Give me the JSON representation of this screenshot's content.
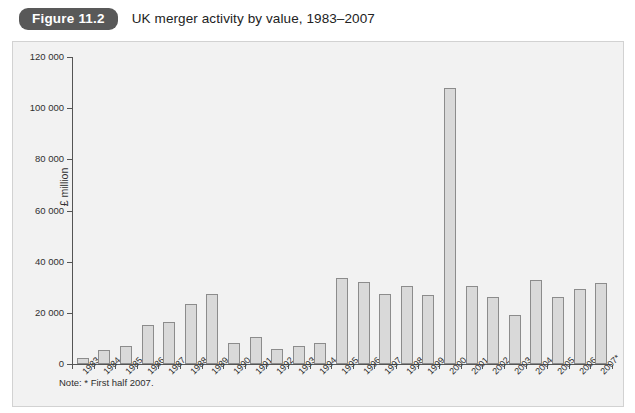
{
  "header": {
    "badge_label": "Figure 11.2",
    "title": "UK merger activity by value, 1983–2007"
  },
  "note": "Note: * First half 2007.",
  "colors": {
    "badge_bg": "#595959",
    "panel_bg": "#f2f2f2",
    "bar_fill": "#d9d9d9",
    "bar_stroke": "#8c8c8c",
    "axis": "#555555"
  },
  "chart_data": {
    "type": "bar",
    "title": "UK merger activity by value, 1983–2007",
    "xlabel": "",
    "ylabel": "£ million",
    "ylim": [
      0,
      120000
    ],
    "yticks": [
      0,
      20000,
      40000,
      60000,
      80000,
      100000,
      120000
    ],
    "ytick_labels": [
      "0",
      "20 000",
      "40 000",
      "60 000",
      "80 000",
      "100 000",
      "120 000"
    ],
    "grid": false,
    "legend": null,
    "annotations": [
      "Note: * First half 2007."
    ],
    "categories": [
      "1983",
      "1984",
      "1985",
      "1986",
      "1987",
      "1988",
      "1989",
      "1990",
      "1991",
      "1992",
      "1993",
      "1994",
      "1995",
      "1996",
      "1997",
      "1998",
      "1999",
      "2000",
      "2001",
      "2002",
      "2003",
      "2004",
      "2005",
      "2006",
      "2007*"
    ],
    "values": [
      2300,
      5500,
      7100,
      15400,
      16500,
      23500,
      27500,
      8300,
      10600,
      6000,
      7100,
      8300,
      33500,
      32000,
      27500,
      30500,
      27000,
      108000,
      30500,
      26000,
      19000,
      32700,
      26000,
      29500,
      31700
    ],
    "series": [
      {
        "name": "UK merger activity by value (£ million)",
        "values": [
          2300,
          5500,
          7100,
          15400,
          16500,
          23500,
          27500,
          8300,
          10600,
          6000,
          7100,
          8300,
          33500,
          32000,
          27500,
          30500,
          27000,
          108000,
          30500,
          26000,
          19000,
          32700,
          26000,
          29500,
          31700
        ]
      }
    ]
  }
}
